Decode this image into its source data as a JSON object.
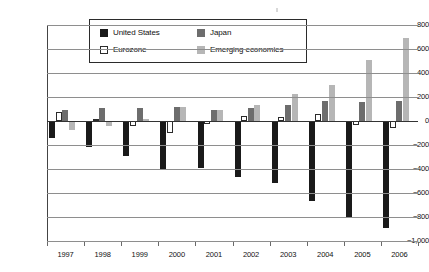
{
  "chart_data": {
    "type": "bar",
    "title": "",
    "subtitle": "",
    "xlabel": "",
    "ylabel": "",
    "categories": [
      "1997",
      "1998",
      "1999",
      "2000",
      "2001",
      "2002",
      "2003",
      "2004",
      "2005",
      "2006"
    ],
    "series": [
      {
        "name": "United States",
        "color": "#1a1a1a",
        "values": [
          -140,
          -213,
          -295,
          -410,
          -390,
          -470,
          -520,
          -665,
          -800,
          -890
        ]
      },
      {
        "name": "Eurozone",
        "color": "#ffffff",
        "values": [
          78,
          18,
          -38,
          -100,
          -22,
          45,
          35,
          60,
          -35,
          -55
        ]
      },
      {
        "name": "Japan",
        "color": "#6d6d6d",
        "values": [
          90,
          110,
          110,
          115,
          88,
          110,
          135,
          170,
          160,
          165
        ]
      },
      {
        "name": "Emerging economies",
        "color": "#b6b6b6",
        "values": [
          -78,
          -45,
          20,
          115,
          90,
          135,
          225,
          300,
          510,
          690
        ]
      }
    ],
    "ylim": [
      -1000,
      800
    ],
    "ytick_values": [
      800,
      600,
      400,
      200,
      0,
      -200,
      -400,
      -600,
      -800,
      -1000
    ],
    "ytick_labels": [
      "800",
      "600",
      "400",
      "200",
      "0",
      "−200",
      "−400",
      "−600",
      "−800",
      "−1,000"
    ],
    "grid": true,
    "legend_position": "top-center",
    "legend_entries": [
      "United States",
      "Eurozone",
      "Japan",
      "Emerging economies"
    ]
  },
  "legend": {
    "united_states": "United States",
    "eurozone": "Eurozone",
    "japan": "Japan",
    "emerging": "Emerging economies"
  }
}
